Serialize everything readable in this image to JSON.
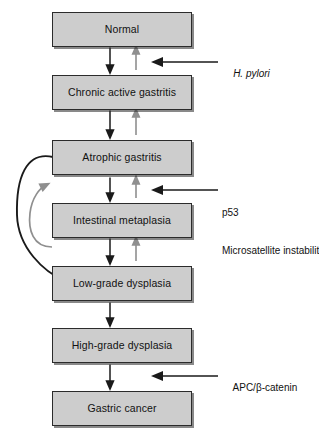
{
  "diagram": {
    "colors": {
      "box_fill": "#cdcdcd",
      "box_border": "#2b2b2b",
      "progression_arrow": "#1a1a1a",
      "regression_arrow": "#8f8f8f",
      "text": "#111111",
      "background": "#ffffff"
    },
    "nodes": [
      {
        "id": "normal",
        "label": "Normal"
      },
      {
        "id": "chronic",
        "label": "Chronic active gastritis"
      },
      {
        "id": "atrophic",
        "label": "Atrophic gastritis"
      },
      {
        "id": "metaplasia",
        "label": "Intestinal metaplasia"
      },
      {
        "id": "lowgrade",
        "label": "Low-grade dysplasia"
      },
      {
        "id": "highgrade",
        "label": "High-grade dysplasia"
      },
      {
        "id": "cancer",
        "label": "Gastric cancer"
      }
    ],
    "annotations": [
      {
        "id": "h-pylori",
        "line1": "H. pylori",
        "line2": "",
        "italic": true,
        "target": "chronic"
      },
      {
        "id": "p53-msi",
        "line1": "p53",
        "line2": "Microsatellite instability",
        "italic": false,
        "target": "metaplasia"
      },
      {
        "id": "apc",
        "line1": "APC/β-catenin",
        "line2": "",
        "italic": false,
        "target": "cancer"
      }
    ],
    "edges": [
      {
        "from": "normal",
        "to": "chronic",
        "direction": "down",
        "kind": "progression"
      },
      {
        "from": "chronic",
        "to": "normal",
        "direction": "up",
        "kind": "regression"
      },
      {
        "from": "chronic",
        "to": "atrophic",
        "direction": "down",
        "kind": "progression"
      },
      {
        "from": "atrophic",
        "to": "chronic",
        "direction": "up",
        "kind": "regression"
      },
      {
        "from": "atrophic",
        "to": "metaplasia",
        "direction": "down",
        "kind": "progression"
      },
      {
        "from": "metaplasia",
        "to": "atrophic",
        "direction": "up",
        "kind": "regression"
      },
      {
        "from": "metaplasia",
        "to": "lowgrade",
        "direction": "down",
        "kind": "progression"
      },
      {
        "from": "lowgrade",
        "to": "metaplasia",
        "direction": "up",
        "kind": "regression"
      },
      {
        "from": "lowgrade",
        "to": "highgrade",
        "direction": "down",
        "kind": "progression"
      },
      {
        "from": "highgrade",
        "to": "cancer",
        "direction": "down",
        "kind": "progression"
      },
      {
        "from": "atrophic",
        "to": "lowgrade",
        "direction": "curve-left-down",
        "kind": "progression-bypass"
      },
      {
        "from": "metaplasia",
        "to": "atrophic",
        "direction": "curve-left-up",
        "kind": "regression-bypass"
      }
    ]
  }
}
